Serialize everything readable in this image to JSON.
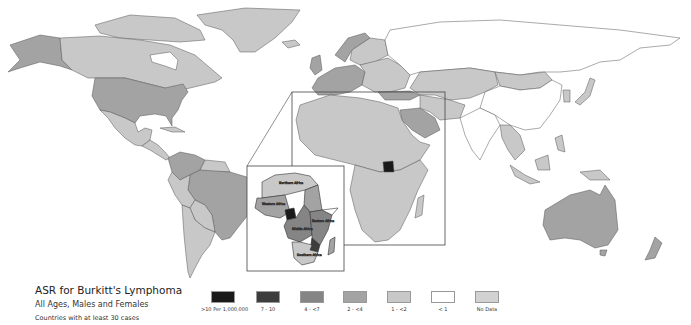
{
  "title": "ASR for Burkitt's Lymphoma",
  "subtitle": "All Ages, Males and Females",
  "note": "Countries with at least 30 cases",
  "legend": [
    {
      "label": ">10 Per 1,000,000",
      "color": "#1a1a1a"
    },
    {
      "label": "7 - 10",
      "color": "#3d3d3d"
    },
    {
      "label": "4 - <7",
      "color": "#858585"
    },
    {
      "label": "2 - <4",
      "color": "#a3a3a3"
    },
    {
      "label": "1 - <2",
      "color": "#c8c8c8"
    },
    {
      "label": "< 1",
      "color": "#ffffff"
    },
    {
      "label": "No Data",
      "color": "#d2d2d2"
    }
  ],
  "inset": {
    "regions": [
      "Northern Africa",
      "Western Africa",
      "Middle Africa",
      "Eastern Africa",
      "Southern Africa"
    ]
  },
  "regions_shading": {
    "North America": {
      "USA": "2 - <4",
      "Canada": "1 - <2",
      "Alaska": "2 - <4",
      "Mexico": "1 - <2",
      "Greenland": "1 - <2"
    },
    "South America": {
      "Brazil": "2 - <4",
      "Venezuela": "2 - <4",
      "Others": "1 - <2"
    },
    "Europe": {
      "Western Europe": "2 - <4",
      "Eastern Europe": "1 - <2"
    },
    "Asia": {
      "Russia": "< 1",
      "China": "< 1",
      "Saudi Arabia": "2 - <4",
      "Kazakhstan": "1 - <2",
      "Mongolia": "1 - <2"
    },
    "Africa": {
      "Uganda": ">10 Per 1,000,000",
      "Others": "1 - <2"
    },
    "Oceania": {
      "Australia": "2 - <4",
      "New Zealand": "2 - <4"
    }
  }
}
